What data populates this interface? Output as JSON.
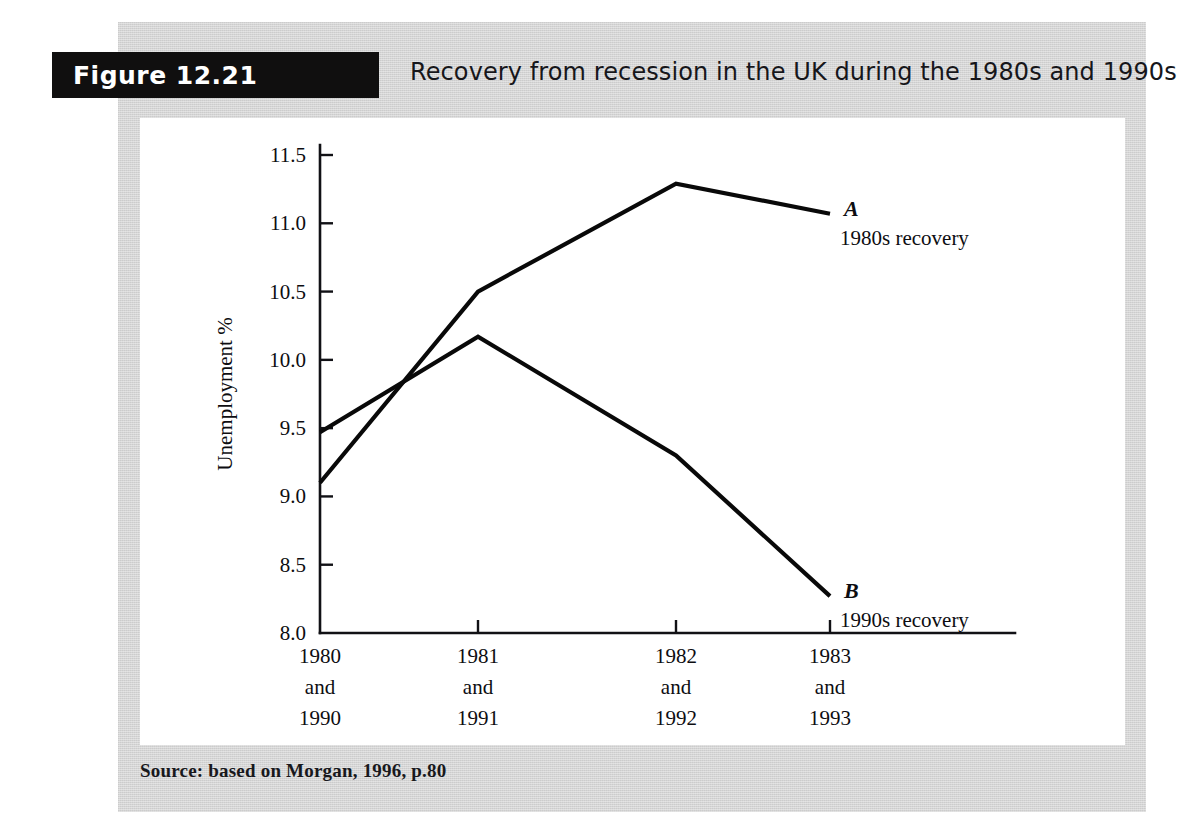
{
  "figure": {
    "badge_label": "Figure 12.21",
    "caption": "Recovery from recession in the UK during the 1980s and 1990s",
    "source": "Source: based on Morgan, 1996, p.80"
  },
  "colors": {
    "panel_gray": "#d5d5d5",
    "badge_black": "#100f0f",
    "canvas_white": "#ffffff",
    "line_black": "#090909"
  },
  "chart_data": {
    "type": "line",
    "title": "Recovery from recession in the UK during the 1980s and 1990s",
    "xlabel": "Time since trough (years)",
    "ylabel": "Unemployment %",
    "categories": [
      "1980 and 1990",
      "1981 and 1991",
      "1982 and 1992",
      "1983 and 1993"
    ],
    "category_lines": [
      [
        "1980",
        "and",
        "1990"
      ],
      [
        "1981",
        "and",
        "1991"
      ],
      [
        "1982",
        "and",
        "1992"
      ],
      [
        "1983",
        "and",
        "1993"
      ]
    ],
    "ylim": [
      8.0,
      11.5
    ],
    "yticks": [
      8.0,
      8.5,
      9.0,
      9.5,
      10.0,
      10.5,
      11.0,
      11.5
    ],
    "ytick_labels": [
      "8.0",
      "8.5",
      "9.0",
      "9.5",
      "10.0",
      "10.5",
      "11.0",
      "11.5"
    ],
    "grid": false,
    "legend_position": "inline-annotation",
    "series": [
      {
        "key": "A",
        "name": "1980s recovery",
        "values": [
          9.1,
          10.5,
          11.29,
          11.07
        ]
      },
      {
        "key": "B",
        "name": "1990s recovery",
        "values": [
          9.47,
          10.17,
          9.3,
          8.27
        ]
      }
    ]
  }
}
